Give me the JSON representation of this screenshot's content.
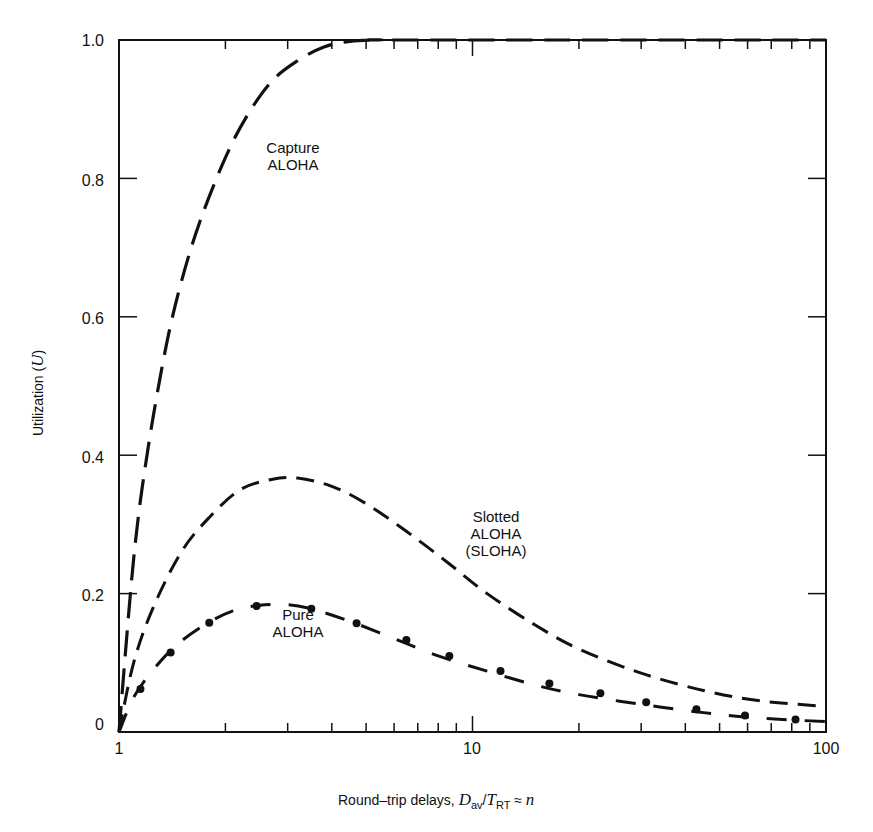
{
  "chart_data": {
    "type": "line",
    "title": "",
    "xlabel": "Round–trip delays, D_av/T_RT ≈ n",
    "ylabel": "Utilization (U)",
    "xscale": "log",
    "xlim": [
      1,
      100
    ],
    "ylim": [
      0,
      1.0
    ],
    "x_ticks": [
      "1",
      "10",
      "100"
    ],
    "y_ticks": [
      "0",
      "0.2",
      "0.4",
      "0.6",
      "0.8",
      "1.0"
    ],
    "grid": false,
    "legend": "inline annotations",
    "series": [
      {
        "name": "Capture ALOHA",
        "label_lines": [
          "Capture",
          "ALOHA"
        ],
        "style": "long-dash",
        "x": [
          1.0,
          1.1,
          1.2,
          1.35,
          1.5,
          1.7,
          2.0,
          2.3,
          2.7,
          3.2,
          3.8,
          4.5,
          5.5,
          6.5,
          100
        ],
        "y": [
          0.0,
          0.25,
          0.4,
          0.55,
          0.65,
          0.74,
          0.83,
          0.89,
          0.94,
          0.97,
          0.99,
          0.998,
          1.0,
          1.0,
          1.0
        ]
      },
      {
        "name": "Slotted ALOHA (SLOHA)",
        "label_lines": [
          "Slotted",
          "ALOHA",
          "(SLOHA)"
        ],
        "style": "dash",
        "x": [
          1.0,
          1.1,
          1.25,
          1.5,
          1.8,
          2.2,
          2.7,
          3.2,
          4.0,
          5.0,
          6.5,
          8.5,
          11,
          15,
          20,
          30,
          45,
          65,
          100
        ],
        "y": [
          0.0,
          0.1,
          0.18,
          0.26,
          0.31,
          0.35,
          0.365,
          0.367,
          0.355,
          0.33,
          0.29,
          0.245,
          0.2,
          0.155,
          0.12,
          0.085,
          0.06,
          0.045,
          0.037
        ]
      },
      {
        "name": "Pure ALOHA",
        "label_lines": [
          "Pure",
          "ALOHA"
        ],
        "style": "dash-dot",
        "x": [
          1.0,
          1.1,
          1.25,
          1.45,
          1.75,
          2.1,
          2.5,
          3.0,
          3.5,
          4.5,
          6.0,
          8.0,
          11,
          15,
          20,
          30,
          45,
          65,
          100
        ],
        "y": [
          0.0,
          0.05,
          0.09,
          0.125,
          0.155,
          0.175,
          0.183,
          0.184,
          0.178,
          0.16,
          0.135,
          0.11,
          0.088,
          0.068,
          0.054,
          0.04,
          0.028,
          0.02,
          0.015
        ],
        "markers_x": [
          1.15,
          1.4,
          1.8,
          2.45,
          3.5,
          4.7,
          6.5,
          8.6,
          12,
          16.5,
          23,
          31,
          43,
          59,
          82
        ],
        "markers_y": [
          0.062,
          0.115,
          0.158,
          0.182,
          0.178,
          0.157,
          0.133,
          0.11,
          0.088,
          0.07,
          0.056,
          0.043,
          0.033,
          0.024,
          0.018
        ]
      }
    ]
  },
  "axes": {
    "y_ticks": [
      "0",
      "0.2",
      "0.4",
      "0.6",
      "0.8",
      "1.0"
    ],
    "x_ticks": [
      "1",
      "10",
      "100"
    ],
    "ylabel_text": "Utilization (",
    "ylabel_var": "U",
    "ylabel_close": ")",
    "xlabel_text": "Round–trip delays, ",
    "xlabel_D": "D",
    "xlabel_Dsub": "av",
    "xlabel_slash": "/",
    "xlabel_T": "T",
    "xlabel_Tsub": "RT",
    "xlabel_approx": " ≈ ",
    "xlabel_n": "n"
  },
  "labels": {
    "capture": [
      "Capture",
      "ALOHA"
    ],
    "slotted": [
      "Slotted",
      "ALOHA",
      "(SLOHA)"
    ],
    "pure": [
      "Pure",
      "ALOHA"
    ]
  },
  "colors": {
    "line": "#111111",
    "background": "#ffffff"
  }
}
